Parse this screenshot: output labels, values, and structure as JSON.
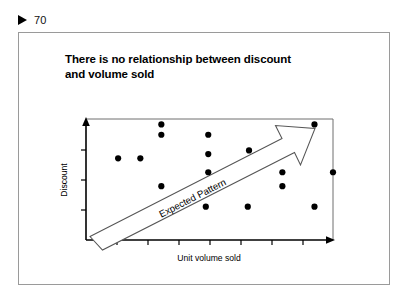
{
  "page_marker": {
    "icon": "play-triangle-icon",
    "number": "70"
  },
  "slide": {
    "title_line1": "There is no relationship between discount",
    "title_line2": "and volume sold"
  },
  "chart_data": {
    "type": "scatter",
    "title": "There is no relationship between discount and volume sold",
    "xlabel": "Unit volume sold",
    "ylabel": "Discount",
    "xlim": [
      0,
      10
    ],
    "ylim": [
      0,
      10
    ],
    "grid": false,
    "legend": null,
    "x_ticks": [
      1.25,
      2.5,
      3.75,
      5.0,
      6.25,
      7.5,
      8.75
    ],
    "x_tick_labels": [],
    "y_ticks": [
      2.5,
      5.0,
      7.5
    ],
    "y_tick_labels": [],
    "points": [
      {
        "x": 3.05,
        "y": 9.55
      },
      {
        "x": 3.05,
        "y": 8.7
      },
      {
        "x": 1.3,
        "y": 6.75
      },
      {
        "x": 2.2,
        "y": 6.75
      },
      {
        "x": 3.05,
        "y": 4.45
      },
      {
        "x": 4.95,
        "y": 8.7
      },
      {
        "x": 4.95,
        "y": 7.1
      },
      {
        "x": 4.95,
        "y": 5.6
      },
      {
        "x": 4.85,
        "y": 2.75
      },
      {
        "x": 6.6,
        "y": 7.4
      },
      {
        "x": 6.55,
        "y": 2.75
      },
      {
        "x": 7.95,
        "y": 5.6
      },
      {
        "x": 7.95,
        "y": 4.45
      },
      {
        "x": 9.25,
        "y": 9.55
      },
      {
        "x": 9.25,
        "y": 2.75
      },
      {
        "x": 10.0,
        "y": 5.6
      }
    ],
    "annotations": [
      {
        "name": "expected-pattern-arrow",
        "text": "Expected  Pattern",
        "style": "outlined-block-arrow",
        "direction": "up-right",
        "from": {
          "x": 0.35,
          "y": 0.55
        },
        "to": {
          "x": 9.85,
          "y": 9.8
        }
      }
    ]
  }
}
